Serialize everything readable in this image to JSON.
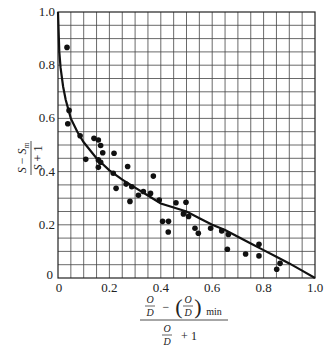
{
  "chart_data": {
    "type": "scatter",
    "title": "",
    "xlabel": "[O/D − (O/D)min] / (O/D + 1)",
    "ylabel": "(S − Sm) / (S + 1)",
    "xlim": [
      0,
      1.0
    ],
    "ylim": [
      0,
      1.0
    ],
    "grid": true,
    "grid_spacing": 0.05,
    "legend": null,
    "x_ticks": [
      "0",
      "0.2",
      "0.4",
      "0.6",
      "0.8",
      "1.0"
    ],
    "y_ticks": [
      "0",
      "0.2",
      "0.4",
      "0.6",
      "0.8",
      "1.0"
    ],
    "x_tick_values": [
      0,
      0.2,
      0.4,
      0.6,
      0.8,
      1.0
    ],
    "y_tick_values": [
      0,
      0.2,
      0.4,
      0.6,
      0.8,
      1.0
    ],
    "series": [
      {
        "name": "experimental data",
        "kind": "scatter",
        "points": [
          [
            0.035,
            0.867
          ],
          [
            0.043,
            0.63
          ],
          [
            0.038,
            0.58
          ],
          [
            0.086,
            0.535
          ],
          [
            0.14,
            0.525
          ],
          [
            0.157,
            0.519
          ],
          [
            0.166,
            0.498
          ],
          [
            0.174,
            0.471
          ],
          [
            0.218,
            0.469
          ],
          [
            0.108,
            0.446
          ],
          [
            0.157,
            0.444
          ],
          [
            0.166,
            0.435
          ],
          [
            0.157,
            0.416
          ],
          [
            0.271,
            0.419
          ],
          [
            0.215,
            0.394
          ],
          [
            0.371,
            0.383
          ],
          [
            0.265,
            0.353
          ],
          [
            0.287,
            0.343
          ],
          [
            0.226,
            0.337
          ],
          [
            0.332,
            0.325
          ],
          [
            0.36,
            0.318
          ],
          [
            0.313,
            0.311
          ],
          [
            0.28,
            0.288
          ],
          [
            0.394,
            0.293
          ],
          [
            0.459,
            0.283
          ],
          [
            0.498,
            0.285
          ],
          [
            0.488,
            0.241
          ],
          [
            0.508,
            0.231
          ],
          [
            0.407,
            0.213
          ],
          [
            0.43,
            0.213
          ],
          [
            0.429,
            0.173
          ],
          [
            0.533,
            0.187
          ],
          [
            0.546,
            0.168
          ],
          [
            0.594,
            0.187
          ],
          [
            0.637,
            0.177
          ],
          [
            0.663,
            0.164
          ],
          [
            0.659,
            0.108
          ],
          [
            0.73,
            0.09
          ],
          [
            0.782,
            0.127
          ],
          [
            0.782,
            0.083
          ],
          [
            0.864,
            0.055
          ],
          [
            0.851,
            0.033
          ]
        ]
      },
      {
        "name": "correlation curve",
        "kind": "line",
        "x": [
          0,
          0.005,
          0.01,
          0.02,
          0.03,
          0.05,
          0.075,
          0.1,
          0.15,
          0.2,
          0.25,
          0.3,
          0.35,
          0.4,
          0.45,
          0.5,
          0.55,
          0.6,
          0.65,
          0.7,
          0.75,
          0.8,
          0.85,
          0.9,
          0.95,
          1.0
        ],
        "y": [
          1.0,
          0.85,
          0.79,
          0.72,
          0.67,
          0.6,
          0.55,
          0.51,
          0.45,
          0.405,
          0.37,
          0.34,
          0.31,
          0.28,
          0.265,
          0.25,
          0.225,
          0.2,
          0.18,
          0.155,
          0.13,
          0.105,
          0.08,
          0.055,
          0.028,
          0.0
        ]
      }
    ]
  },
  "labels": {
    "y_axis": {
      "num_a": "S",
      "minus": "−",
      "num_b": "S",
      "sub": "m",
      "den_a": "S",
      "plus": "+ 1"
    },
    "x_axis": {
      "o": "O",
      "d": "D",
      "minus": "−",
      "min": "min",
      "plus": "+ 1"
    },
    "origin_y": "0",
    "origin_x": "0"
  }
}
